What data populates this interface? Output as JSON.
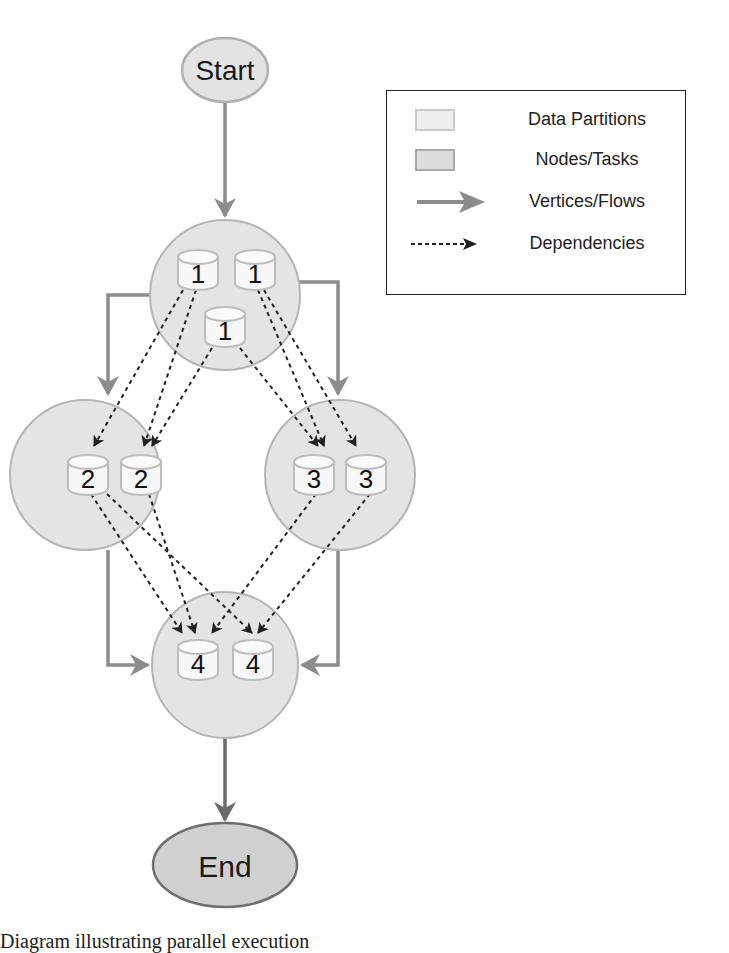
{
  "diagram": {
    "start_label": "Start",
    "end_label": "End",
    "nodes": [
      {
        "id": "node-1",
        "partitions": [
          "1",
          "1",
          "1"
        ]
      },
      {
        "id": "node-2",
        "partitions": [
          "2",
          "2"
        ]
      },
      {
        "id": "node-3",
        "partitions": [
          "3",
          "3"
        ]
      },
      {
        "id": "node-4",
        "partitions": [
          "4",
          "4"
        ]
      }
    ],
    "colors": {
      "node_fill": "#e4e4e4",
      "node_stroke": "#b5b5b5",
      "partition_fill": "#f7f7f7",
      "partition_stroke": "#bdbdbd",
      "flow_arrow": "#8c8c8c",
      "end_fill": "#cfcfcf",
      "end_stroke": "#6e6e6e",
      "dependency": "#222222"
    }
  },
  "legend": {
    "items": [
      {
        "label": "Data Partitions",
        "icon": "partition-swatch"
      },
      {
        "label": "Nodes/Tasks",
        "icon": "node-swatch"
      },
      {
        "label": "Vertices/Flows",
        "icon": "solid-arrow-icon"
      },
      {
        "label": "Dependencies",
        "icon": "dashed-arrow-icon"
      }
    ]
  },
  "caption": "Diagram illustrating parallel execution"
}
